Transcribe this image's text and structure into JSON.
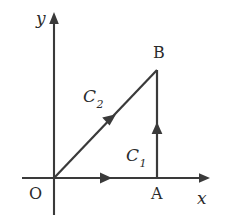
{
  "figure": {
    "background_color": "#ffffff",
    "stroke_color": "#3a3a3a",
    "text_color": "#2b2b2b"
  },
  "axes": {
    "x_label": "x",
    "y_label": "y",
    "origin_label": "O",
    "x_axis": {
      "x1": 22,
      "y1": 178,
      "x2": 210,
      "y2": 178,
      "arrow_end": true
    },
    "y_axis": {
      "x1": 54,
      "y1": 215,
      "x2": 54,
      "y2": 12,
      "arrow_end": true
    }
  },
  "points": [
    {
      "name": "O",
      "label": "O",
      "x": 54,
      "y": 178
    },
    {
      "name": "A",
      "label": "A",
      "x": 157,
      "y": 178
    },
    {
      "name": "B",
      "label": "B",
      "x": 157,
      "y": 70
    }
  ],
  "curves": [
    {
      "name": "C1",
      "label": "C",
      "subscript": "1",
      "description": "path from O along x-axis to A then vertically up to B",
      "segments": [
        {
          "from": "O",
          "to": "A",
          "arrow_at": {
            "x": 106,
            "y": 178
          },
          "direction": "right"
        },
        {
          "from": "A",
          "to": "B",
          "arrow_at": {
            "x": 157,
            "y": 129
          },
          "direction": "up"
        }
      ]
    },
    {
      "name": "C2",
      "label": "C",
      "subscript": "2",
      "description": "straight diagonal path from O to B",
      "segments": [
        {
          "from": "O",
          "to": "B",
          "arrow_at": {
            "x": 110,
            "y": 120
          },
          "direction": "up-right"
        }
      ]
    }
  ]
}
